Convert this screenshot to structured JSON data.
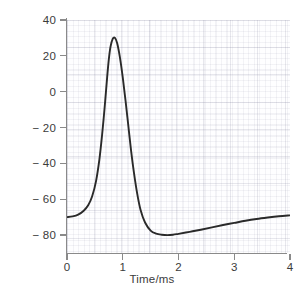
{
  "chart_data": {
    "type": "line",
    "title": "",
    "xlabel": "Time/ms",
    "ylabel": "Potential difference/mV",
    "xlim": [
      0,
      4
    ],
    "ylim": [
      -90,
      40
    ],
    "grid": true,
    "legend": "none",
    "x_ticks": [
      "0",
      "1",
      "2",
      "3",
      "4"
    ],
    "x_tick_values": [
      0,
      1,
      2,
      3,
      4
    ],
    "y_ticks": [
      "40",
      "20",
      "0",
      "− 20",
      "− 40",
      "− 60",
      "− 80"
    ],
    "y_tick_values": [
      40,
      20,
      0,
      -20,
      -40,
      -60,
      -80
    ],
    "series": [
      {
        "name": "Action potential",
        "color": "#2a2a2a",
        "x": [
          0.0,
          0.1,
          0.2,
          0.3,
          0.38,
          0.45,
          0.52,
          0.58,
          0.63,
          0.68,
          0.72,
          0.75,
          0.78,
          0.82,
          0.86,
          0.9,
          0.95,
          1.0,
          1.05,
          1.1,
          1.15,
          1.2,
          1.26,
          1.32,
          1.4,
          1.5,
          1.6,
          1.7,
          1.8,
          1.9,
          2.0,
          2.2,
          2.4,
          2.6,
          2.8,
          3.0,
          3.2,
          3.4,
          3.6,
          3.8,
          4.0
        ],
        "y": [
          -70.0,
          -69.6,
          -68.6,
          -66.4,
          -63.4,
          -58.5,
          -50.0,
          -38.0,
          -24.0,
          -7.0,
          8.0,
          18.0,
          25.0,
          29.5,
          30.0,
          27.0,
          19.0,
          8.0,
          -5.0,
          -19.0,
          -33.0,
          -45.0,
          -57.0,
          -66.0,
          -73.0,
          -77.5,
          -79.2,
          -79.8,
          -80.0,
          -79.8,
          -79.3,
          -78.2,
          -77.0,
          -75.7,
          -74.4,
          -73.2,
          -72.0,
          -71.0,
          -70.2,
          -69.5,
          -69.0
        ]
      }
    ],
    "annotations": []
  },
  "axes": {
    "x_title": "Time/ms",
    "y_title": "Potential difference/mV"
  },
  "style": {
    "curve_color": "#2a2a2a",
    "axis_color": "#8a8a8a",
    "text_color": "#3b3b3b",
    "grid_color": "#e8e8ef",
    "background": "#ffffff"
  }
}
